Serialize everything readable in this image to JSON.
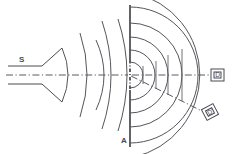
{
  "figure": {
    "background_color": "#ffffff",
    "line_color": "#4a4a4f",
    "width": 232,
    "height": 154
  },
  "labels": {
    "source": "S",
    "aperture": "A",
    "detector_axial": "D",
    "detector_offaxis": "D'"
  },
  "elements": {
    "source_horn_name": "wave source horn",
    "barrier_name": "barrier screen with aperture",
    "axis_name": "optical axis centerline",
    "incident_wavefronts_count": 4,
    "diffracted_wavefronts_count": 6,
    "tick_marks_count": 4
  },
  "geometry": {
    "aperture_x": 130,
    "aperture_y": 75,
    "barrier_top_y": 6,
    "barrier_bottom_y": 146,
    "axis_y": 75,
    "horn_mouth_x": 62,
    "guide_top_y": 66,
    "guide_bottom_y": 84,
    "diagonal_angle_deg": 28
  },
  "incident_arcs": [
    {
      "radius": 28,
      "sweep_deg": 86
    },
    {
      "radius": 45,
      "sweep_deg": 74
    },
    {
      "radius": 60,
      "sweep_deg": 84
    },
    {
      "radius": 78,
      "sweep_deg": 86
    },
    {
      "radius": 96,
      "sweep_deg": 88
    }
  ],
  "diffracted_arcs": [
    {
      "radius": 13
    },
    {
      "radius": 25
    },
    {
      "radius": 38
    },
    {
      "radius": 52
    },
    {
      "radius": 68
    },
    {
      "radius": 84
    }
  ],
  "axis_ticks": [
    {
      "x": 143,
      "half_height": 9
    },
    {
      "x": 156,
      "half_height": 14
    },
    {
      "x": 168,
      "half_height": 20
    },
    {
      "x": 182,
      "half_height": 26
    }
  ],
  "detectors": [
    {
      "id": "detector-axial",
      "label": "D",
      "x": 212,
      "y": 71,
      "width": 13,
      "height": 11,
      "rotation_deg": 0
    },
    {
      "id": "detector-offaxis",
      "label": "D'",
      "x": 204,
      "y": 106,
      "width": 13,
      "height": 11,
      "rotation_deg": -28
    }
  ]
}
